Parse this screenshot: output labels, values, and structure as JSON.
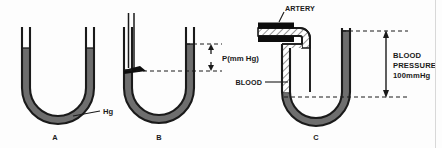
{
  "figure": {
    "background_color": "#fdfdfd",
    "mercury_color": "#6e6e6e",
    "blood_hatch_color": "#2a2a2a",
    "outline_color": "#1a1a1a"
  },
  "panels": [
    {
      "id": "A",
      "label": "A",
      "caption_label": "Hg",
      "description": "Open U-tube manometer with mercury at equal levels in both arms"
    },
    {
      "id": "B",
      "label": "B",
      "pressure_label": "P(mm Hg)",
      "description": "U-tube manometer with gas inlet tube, mercury displaced showing pressure difference"
    },
    {
      "id": "C",
      "label": "C",
      "artery_label": "ARTERY",
      "blood_label": "BLOOD",
      "pressure_label_line1": "BLOOD",
      "pressure_label_line2": "PRESSURE",
      "pressure_label_line3": "100mmHg",
      "description": "Artery connected to mercury manometer measuring blood pressure"
    }
  ]
}
